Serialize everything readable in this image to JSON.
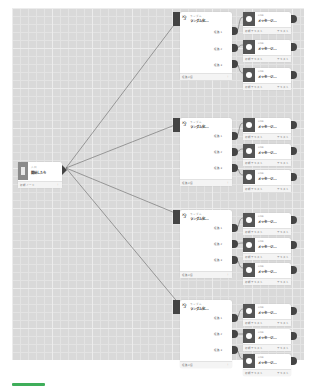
{
  "canvas": {
    "background": "#d9d9d9",
    "grid_color": "#ececec"
  },
  "start_node": {
    "small_label": "入口",
    "title": "開始したら",
    "footer_left": "初期ノード",
    "footer_right": "⋮",
    "icon": "entry-icon"
  },
  "randomizers": [
    {
      "small_label": "ランダム",
      "title": "ランダム化...",
      "paths": [
        "経路1",
        "経路2",
        "経路3"
      ],
      "footer_left": "経路3個",
      "footer_right": "⋮",
      "icon": "randomize-icon"
    },
    {
      "small_label": "ランダム",
      "title": "ランダム化...",
      "paths": [
        "経路1",
        "経路2",
        "経路3"
      ],
      "footer_left": "経路3個",
      "footer_right": "⋮",
      "icon": "randomize-icon"
    },
    {
      "small_label": "ランダム",
      "title": "ランダム化...",
      "paths": [
        "経路1",
        "経路2",
        "経路3"
      ],
      "footer_left": "経路3個",
      "footer_right": "⋮",
      "icon": "randomize-icon"
    },
    {
      "small_label": "ランダム",
      "title": "ランダム化...",
      "paths": [
        "経路1",
        "経路2",
        "経路3"
      ],
      "footer_left": "経路3個",
      "footer_right": "⋮",
      "icon": "randomize-icon"
    }
  ],
  "messages": [
    {
      "small_label": "LINE",
      "title": "メッセージ...",
      "footer_left": "初期テキスト",
      "footer_right": "テキスト"
    },
    {
      "small_label": "LINE",
      "title": "メッセージ...",
      "footer_left": "初期テキスト",
      "footer_right": "テキスト"
    },
    {
      "small_label": "LINE",
      "title": "メッセージ...",
      "footer_left": "初期テキスト",
      "footer_right": "テキスト"
    },
    {
      "small_label": "LINE",
      "title": "メッセージ...",
      "footer_left": "初期テキスト",
      "footer_right": "テキスト"
    },
    {
      "small_label": "LINE",
      "title": "メッセージ...",
      "footer_left": "初期テキスト",
      "footer_right": "テキスト"
    },
    {
      "small_label": "LINE",
      "title": "メッセージ...",
      "footer_left": "初期テキスト",
      "footer_right": "テキスト"
    },
    {
      "small_label": "LINE",
      "title": "メッセージ...",
      "footer_left": "初期テキスト",
      "footer_right": "テキスト"
    },
    {
      "small_label": "LINE",
      "title": "メッセージ...",
      "footer_left": "初期テキスト",
      "footer_right": "テキスト"
    },
    {
      "small_label": "LINE",
      "title": "メッセージ...",
      "footer_left": "初期テキスト",
      "footer_right": "テキスト"
    },
    {
      "small_label": "LINE",
      "title": "メッセージ...",
      "footer_left": "初期テキスト",
      "footer_right": "テキスト"
    },
    {
      "small_label": "LINE",
      "title": "メッセージ...",
      "footer_left": "初期テキスト",
      "footer_right": "テキスト"
    },
    {
      "small_label": "LINE",
      "title": "メッセージ...",
      "footer_left": "初期テキスト",
      "footer_right": "テキスト"
    }
  ],
  "accent_bar_color": "#3fae5a"
}
